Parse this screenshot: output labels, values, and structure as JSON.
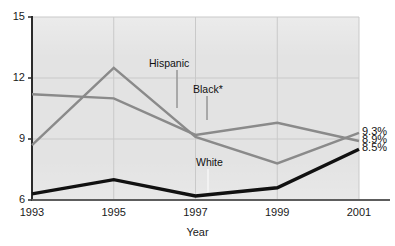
{
  "chart_data": {
    "type": "line",
    "title": "",
    "xlabel": "Year",
    "ylabel": "",
    "x": [
      1993,
      1995,
      1997,
      1999,
      2001
    ],
    "xtick_labels": [
      "1993",
      "1995",
      "1997",
      "1999",
      "2001"
    ],
    "ytick_labels": [
      "6",
      "9",
      "12",
      "15"
    ],
    "yticks": [
      6,
      9,
      12,
      15
    ],
    "ylim": [
      6,
      15
    ],
    "xlim": [
      1993,
      2001
    ],
    "grid": true,
    "legend": "inline-annotations",
    "series": [
      {
        "name": "Hispanic",
        "color": "#8a8a8a",
        "values": [
          8.7,
          12.5,
          9.1,
          7.8,
          9.3
        ],
        "end_label": "9.3%"
      },
      {
        "name": "Black*",
        "color": "#8a8a8a",
        "values": [
          11.2,
          11.0,
          9.2,
          9.8,
          8.9
        ],
        "end_label": "8.9%"
      },
      {
        "name": "White",
        "color": "#111111",
        "values": [
          6.3,
          7.0,
          6.2,
          6.6,
          8.5
        ],
        "end_label": "8.5%"
      }
    ],
    "annotations": [
      {
        "text": "Hispanic",
        "series": "Hispanic"
      },
      {
        "text": "Black*",
        "series": "Black*"
      },
      {
        "text": "White",
        "series": "White"
      }
    ]
  }
}
